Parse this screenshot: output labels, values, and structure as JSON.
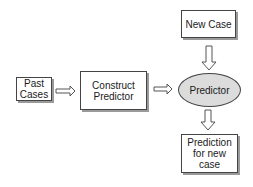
{
  "nodes": {
    "new_case": {
      "label": "New Case"
    },
    "past_cases": {
      "label": "Past\nCases"
    },
    "construct_predictor": {
      "label": "Construct\nPredictor"
    },
    "predictor": {
      "label": "Predictor"
    },
    "prediction": {
      "label": "Prediction\nfor new case"
    }
  },
  "edges": [
    {
      "from": "past_cases",
      "to": "construct_predictor"
    },
    {
      "from": "construct_predictor",
      "to": "predictor"
    },
    {
      "from": "new_case",
      "to": "predictor"
    },
    {
      "from": "predictor",
      "to": "prediction"
    }
  ],
  "colors": {
    "ellipse_fill": "#dcdcdc",
    "border": "#444444"
  }
}
